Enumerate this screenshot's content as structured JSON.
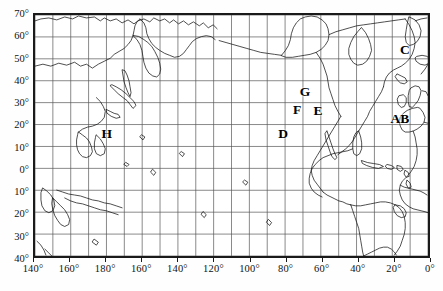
{
  "figure": {
    "type": "world-map-plot",
    "projection": "cylindrical-equidistant",
    "background_color": "#ffffff",
    "frame_color": "#1a1a1a",
    "grid_color": "#555555",
    "coast_color": "#111111",
    "label_color": "#111111"
  },
  "axes": {
    "x_label_text": "",
    "y_label_text": "",
    "x_ticks": [
      {
        "label": "140°",
        "lon": 140
      },
      {
        "label": "160°",
        "lon": 160
      },
      {
        "label": "180°",
        "lon": 180
      },
      {
        "label": "160°",
        "lon": 200
      },
      {
        "label": "140°",
        "lon": 220
      },
      {
        "label": "120°",
        "lon": 240
      },
      {
        "label": "100°",
        "lon": 260
      },
      {
        "label": "80°",
        "lon": 280
      },
      {
        "label": "60°",
        "lon": 300
      },
      {
        "label": "40°",
        "lon": 320
      },
      {
        "label": "20°",
        "lon": 340
      },
      {
        "label": "0°",
        "lon": 360
      }
    ],
    "y_ticks": [
      {
        "label": "70°",
        "lat": 70
      },
      {
        "label": "60°",
        "lat": 60
      },
      {
        "label": "50°",
        "lat": 50
      },
      {
        "label": "40°",
        "lat": 40
      },
      {
        "label": "30°",
        "lat": 30
      },
      {
        "label": "20°",
        "lat": 20
      },
      {
        "label": "10°",
        "lat": 10
      },
      {
        "label": "0°",
        "lat": 0
      },
      {
        "label": "10°",
        "lat": -10
      },
      {
        "label": "20°",
        "lat": -20
      },
      {
        "label": "30°",
        "lat": -30
      },
      {
        "label": "40°",
        "lat": -40
      }
    ],
    "x_range": [
      140,
      360
    ],
    "y_range": [
      -40,
      70
    ],
    "grid_step_degrees": 10,
    "label_step_degrees": 20
  },
  "map_labels": [
    {
      "text": "H",
      "x_pct": 18.6,
      "y_pct": 49.4,
      "name": "map-label-h"
    },
    {
      "text": "D",
      "x_pct": 63.0,
      "y_pct": 49.4,
      "name": "map-label-d"
    },
    {
      "text": "G",
      "x_pct": 68.5,
      "y_pct": 32.2,
      "name": "map-label-g"
    },
    {
      "text": "F",
      "x_pct": 66.5,
      "y_pct": 39.6,
      "name": "map-label-f"
    },
    {
      "text": "E",
      "x_pct": 71.8,
      "y_pct": 40.0,
      "name": "map-label-e"
    },
    {
      "text": "C",
      "x_pct": 93.7,
      "y_pct": 15.1,
      "name": "map-label-c"
    },
    {
      "text": "AB",
      "x_pct": 92.4,
      "y_pct": 43.3,
      "name": "map-label-ab"
    }
  ],
  "chart_data": {
    "type": "map",
    "title": "",
    "xlabel": "Longitude",
    "ylabel": "Latitude",
    "xlim": [
      140,
      360
    ],
    "ylim": [
      -40,
      70
    ],
    "grid": true,
    "grid_spacing": 10,
    "legend": "none",
    "annotations": [
      {
        "label": "H",
        "lon": 181,
        "lat": 15.8
      },
      {
        "label": "D",
        "lon": 279,
        "lat": 15.8
      },
      {
        "label": "G",
        "lon": 291,
        "lat": 34.7
      },
      {
        "label": "F",
        "lon": 286,
        "lat": 26.4
      },
      {
        "label": "E",
        "lon": 298,
        "lat": 26.0
      },
      {
        "label": "C",
        "lon": 346,
        "lat": 53.4
      },
      {
        "label": "AB",
        "lon": 343,
        "lat": 22.4
      }
    ]
  }
}
